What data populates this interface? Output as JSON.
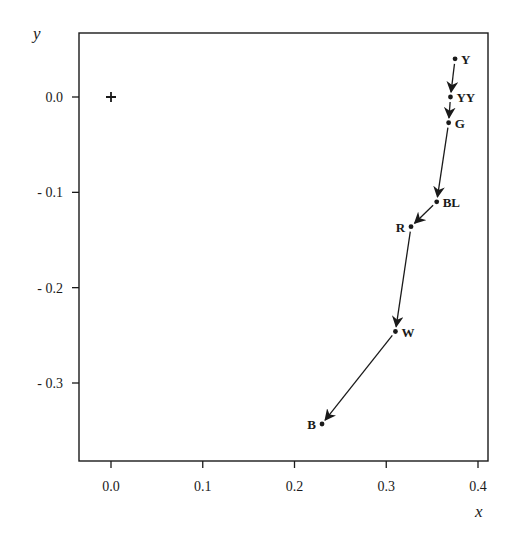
{
  "chart_data": {
    "type": "scatter",
    "title": "",
    "xlabel": "x",
    "ylabel": "y",
    "xlim": [
      -0.035,
      0.41
    ],
    "ylim": [
      -0.385,
      0.07
    ],
    "grid": false,
    "legend": null,
    "x_ticks": [
      0.0,
      0.1,
      0.2,
      0.3,
      0.4
    ],
    "x_tick_labels": [
      "0.0",
      "0.1",
      "0.2",
      "0.3",
      "0.4"
    ],
    "y_ticks": [
      0.0,
      -0.1,
      -0.2,
      -0.3
    ],
    "y_tick_labels": [
      "0.0",
      "- 0.1",
      "- 0.2",
      "- 0.3"
    ],
    "origin_marker": {
      "symbol": "+",
      "x": 0.0,
      "y": 0.0
    },
    "points": [
      {
        "label": "Y",
        "x": 0.375,
        "y": 0.04,
        "label_pos": "right"
      },
      {
        "label": "YY",
        "x": 0.37,
        "y": 0.0,
        "label_pos": "right"
      },
      {
        "label": "G",
        "x": 0.368,
        "y": -0.027,
        "label_pos": "right"
      },
      {
        "label": "BL",
        "x": 0.355,
        "y": -0.11,
        "label_pos": "right"
      },
      {
        "label": "R",
        "x": 0.327,
        "y": -0.136,
        "label_pos": "left"
      },
      {
        "label": "W",
        "x": 0.31,
        "y": -0.246,
        "label_pos": "right"
      },
      {
        "label": "B",
        "x": 0.23,
        "y": -0.343,
        "label_pos": "left"
      }
    ],
    "arrows": [
      {
        "from": "Y",
        "to": "YY"
      },
      {
        "from": "YY",
        "to": "G"
      },
      {
        "from": "G",
        "to": "BL"
      },
      {
        "from": "BL",
        "to": "R"
      },
      {
        "from": "R",
        "to": "W"
      },
      {
        "from": "W",
        "to": "B"
      }
    ]
  },
  "layout": {
    "frame": {
      "left": 79,
      "right": 488,
      "top": 33,
      "bottom": 461
    },
    "x_px": {
      "v0": 0.0,
      "p0": 111,
      "v1": 0.4,
      "p1": 478
    },
    "y_px": {
      "v0": 0.0,
      "p0": 97,
      "v1": -0.3,
      "p1": 383
    },
    "ink": "#1a1a1a"
  }
}
